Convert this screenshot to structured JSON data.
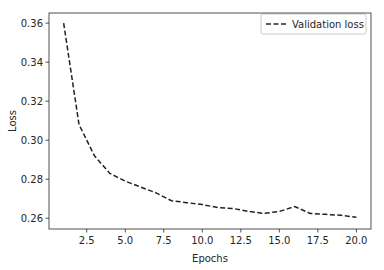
{
  "chart_data": {
    "type": "line",
    "title": "",
    "xlabel": "Epochs",
    "ylabel": "Loss",
    "xlim": [
      0.05,
      20.95
    ],
    "ylim": [
      0.2545,
      0.3652
    ],
    "xticks": [
      2.5,
      5.0,
      7.5,
      10.0,
      12.5,
      15.0,
      17.5,
      20.0
    ],
    "xtick_labels": [
      "2.5",
      "5.0",
      "7.5",
      "10.0",
      "12.5",
      "15.0",
      "17.5",
      "20.0"
    ],
    "yticks": [
      0.26,
      0.28,
      0.3,
      0.32,
      0.34,
      0.36
    ],
    "ytick_labels": [
      "0.26",
      "0.28",
      "0.30",
      "0.32",
      "0.34",
      "0.36"
    ],
    "grid": false,
    "legend_position": "upper right",
    "x": [
      1,
      2,
      3,
      4,
      5,
      6,
      7,
      8,
      9,
      10,
      11,
      12,
      13,
      14,
      15,
      16,
      17,
      18,
      19,
      20
    ],
    "series": [
      {
        "name": "Validation loss",
        "style": "dashed",
        "color": "#222222",
        "values": [
          0.36,
          0.308,
          0.292,
          0.283,
          0.279,
          0.276,
          0.273,
          0.269,
          0.268,
          0.267,
          0.2655,
          0.265,
          0.2635,
          0.2625,
          0.2635,
          0.266,
          0.2625,
          0.262,
          0.2615,
          0.2605
        ]
      }
    ]
  },
  "legend": {
    "items": [
      {
        "label": "Validation loss"
      }
    ]
  },
  "colors": {
    "line": "#222222",
    "axis": "#262626",
    "legend_border": "#cccccc"
  }
}
